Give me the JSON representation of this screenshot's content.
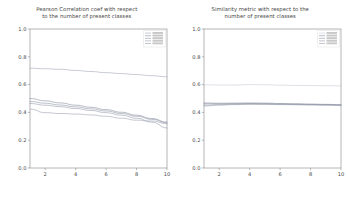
{
  "figure": {
    "width": 347,
    "height": 200,
    "background": "#ffffff"
  },
  "chart_data": [
    {
      "type": "line",
      "panel": "left",
      "title": "Pearson Correlation coef with respect to the number of present classes",
      "title_line1": "Pearson Correlation coef with respect",
      "title_line2": "to the number of present classes",
      "xlabel": "",
      "ylabel": "",
      "xlim": [
        1,
        10
      ],
      "ylim": [
        0.0,
        1.0
      ],
      "xticks": [
        2,
        4,
        6,
        8,
        10
      ],
      "xticklabels": [
        "2",
        "4",
        "6",
        "8",
        "10"
      ],
      "yticks": [
        0.0,
        0.2,
        0.4,
        0.6,
        0.8,
        1.0
      ],
      "yticklabels": [
        "0.0",
        "0.2",
        "0.4",
        "0.6",
        "0.8",
        "1.0"
      ],
      "grid": false,
      "legend_position": "upper right",
      "x": [
        1,
        2,
        3,
        4,
        5,
        6,
        7,
        8,
        9,
        10
      ],
      "series": [
        {
          "name": "series-1",
          "label": "",
          "color": "#9aa0b4",
          "values": [
            0.718,
            0.714,
            0.71,
            0.702,
            0.694,
            0.686,
            0.679,
            0.672,
            0.664,
            0.656
          ]
        },
        {
          "name": "series-2",
          "label": "",
          "color": "#7d8496",
          "values": [
            0.5,
            0.483,
            0.468,
            0.452,
            0.437,
            0.42,
            0.401,
            0.38,
            0.356,
            0.33
          ]
        },
        {
          "name": "series-3",
          "label": "",
          "color": "#858b9c",
          "values": [
            0.479,
            0.466,
            0.453,
            0.44,
            0.426,
            0.41,
            0.392,
            0.372,
            0.35,
            0.325
          ]
        },
        {
          "name": "series-4",
          "label": "",
          "color": "#8d93a4",
          "values": [
            0.464,
            0.452,
            0.441,
            0.428,
            0.414,
            0.398,
            0.38,
            0.358,
            0.33,
            0.288
          ]
        },
        {
          "name": "series-5",
          "label": "",
          "color": "#959bac",
          "values": [
            0.424,
            0.398,
            0.392,
            0.388,
            0.382,
            0.372,
            0.358,
            0.344,
            0.338,
            0.318
          ]
        }
      ]
    },
    {
      "type": "line",
      "panel": "right",
      "title": "Similarity metric with respect to the number of present classes",
      "title_line1": "Similarity metric with respect to the",
      "title_line2": "number of present classes",
      "xlabel": "",
      "ylabel": "",
      "xlim": [
        1,
        10
      ],
      "ylim": [
        0.0,
        1.0
      ],
      "xticks": [
        2,
        4,
        6,
        8,
        10
      ],
      "xticklabels": [
        "2",
        "4",
        "6",
        "8",
        "10"
      ],
      "yticks": [
        0.0,
        0.2,
        0.4,
        0.6,
        0.8,
        1.0
      ],
      "yticklabels": [
        "0.0",
        "0.2",
        "0.4",
        "0.6",
        "0.8",
        "1.0"
      ],
      "grid": false,
      "legend_position": "upper right",
      "x": [
        1,
        2,
        3,
        4,
        5,
        6,
        7,
        8,
        9,
        10
      ],
      "series": [
        {
          "name": "series-1",
          "label": "",
          "color": "#c3c7d2",
          "values": [
            0.598,
            0.597,
            0.597,
            0.6,
            0.599,
            0.596,
            0.594,
            0.593,
            0.592,
            0.591
          ]
        },
        {
          "name": "series-2",
          "label": "",
          "color": "#7d8496",
          "values": [
            0.468,
            0.466,
            0.467,
            0.468,
            0.467,
            0.464,
            0.462,
            0.46,
            0.458,
            0.455
          ]
        },
        {
          "name": "series-3",
          "label": "",
          "color": "#858b9c",
          "values": [
            0.462,
            0.462,
            0.463,
            0.464,
            0.463,
            0.461,
            0.459,
            0.457,
            0.456,
            0.453
          ]
        },
        {
          "name": "series-4",
          "label": "",
          "color": "#8d93a4",
          "values": [
            0.452,
            0.456,
            0.459,
            0.461,
            0.46,
            0.458,
            0.457,
            0.455,
            0.454,
            0.452
          ]
        },
        {
          "name": "series-5",
          "label": "",
          "color": "#959bac",
          "values": [
            0.446,
            0.452,
            0.456,
            0.458,
            0.458,
            0.456,
            0.455,
            0.454,
            0.452,
            0.451
          ]
        }
      ]
    }
  ]
}
